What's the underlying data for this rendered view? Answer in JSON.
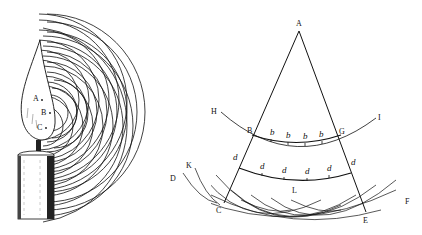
{
  "figures": [
    {
      "id": "candle",
      "description": "Candle flame emitting spherical wavelets from points A, B, C",
      "labels": {
        "A": "A",
        "B": "B",
        "C": "C"
      }
    },
    {
      "id": "wavefront",
      "description": "Huygens construction: cone from A with wavefronts HBGI and DCEF, secondary wavelets b and d",
      "labels": {
        "A": "A",
        "B": "B",
        "G": "G",
        "H": "H",
        "I": "I",
        "K": "K",
        "D": "D",
        "L": "L",
        "C": "C",
        "E": "E",
        "F": "F",
        "b": "b",
        "d": "d"
      }
    }
  ]
}
